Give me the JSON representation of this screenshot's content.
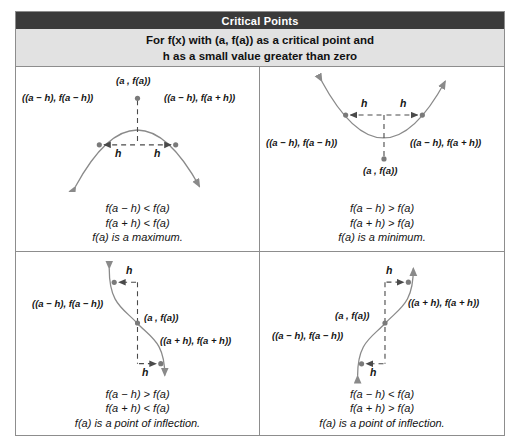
{
  "header": {
    "title": "Critical Points",
    "subtitle_line1": "For f(x) with (a, f(a)) as a critical point and",
    "subtitle_line2": "h as a small value greater than zero"
  },
  "colors": {
    "title_band": "#3b3b3b",
    "subtitle_band": "#e2e2e2",
    "border": "#8d8d8d",
    "curve": "#8a8a8a",
    "dot": "#7a7a7a",
    "dash": "#4a4a4a",
    "text": "#141414",
    "page_background": "#ffffff"
  },
  "panels": [
    {
      "id": "maximum",
      "shape": "concave-down-parabola",
      "labels": {
        "vertex": "(a , f(a))",
        "left_point": "((a − h), f(a − h))",
        "right_point": "((a − h), f(a + h))",
        "h_left": "h",
        "h_right": "h"
      },
      "caption": [
        "f(a − h) < f(a)",
        "f(a + h) < f(a)",
        "f(a) is a maximum."
      ]
    },
    {
      "id": "minimum",
      "shape": "concave-up-parabola",
      "labels": {
        "vertex": "(a , f(a))",
        "left_point": "((a − h), f(a − h))",
        "right_point": "((a − h), f(a + h))",
        "h_left": "h",
        "h_right": "h"
      },
      "caption": [
        "f(a − h) > f(a)",
        "f(a + h) > f(a)",
        "f(a) is a minimum."
      ]
    },
    {
      "id": "inflection-decreasing",
      "shape": "decreasing-inflection",
      "labels": {
        "vertex": "(a , f(a))",
        "left_point": "((a − h), f(a − h))",
        "right_point": "((a + h), f(a + h))",
        "h_top": "h",
        "h_bottom": "h"
      },
      "caption": [
        "f(a − h) > f(a)",
        "f(a + h) < f(a)",
        "f(a) is a point of inflection."
      ]
    },
    {
      "id": "inflection-increasing",
      "shape": "increasing-inflection",
      "labels": {
        "vertex": "(a , f(a))",
        "left_point": "((a − h), f(a − h))",
        "right_point": "((a + h), f(a + h))",
        "h_top": "h",
        "h_bottom": "h"
      },
      "caption": [
        "f(a − h) < f(a)",
        "f(a + h) > f(a)",
        "f(a) is a point of inflection."
      ]
    }
  ]
}
